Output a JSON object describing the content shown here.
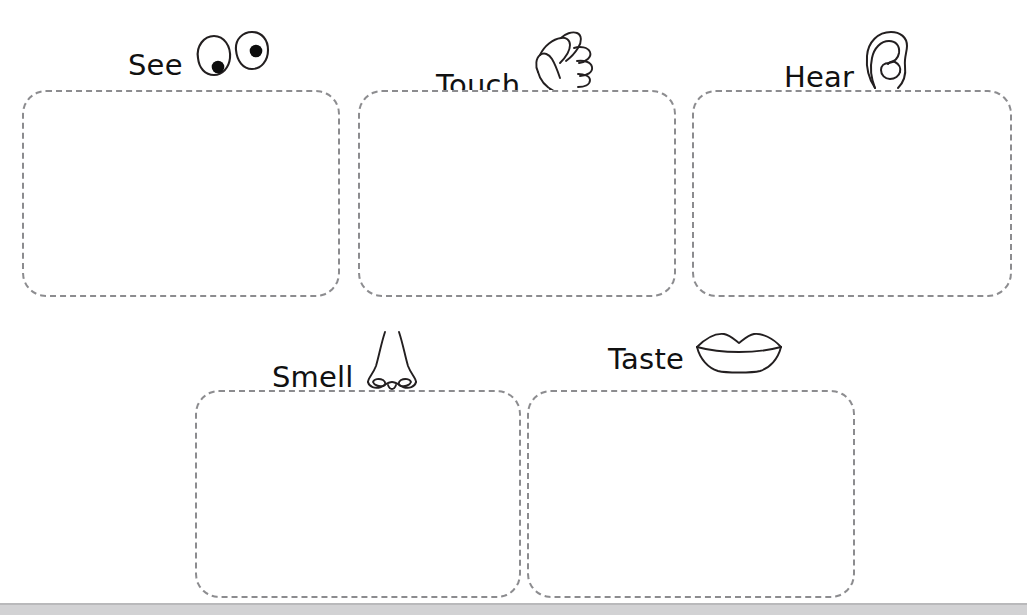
{
  "worksheet": {
    "title": "Five Senses Graphic Organizer",
    "background_color": "#ffffff",
    "box_border_color": "#8c8c8f",
    "label_text_color": "#111111",
    "icon_stroke_color": "#231f20",
    "bottom_strip_color": "#d2d2d4"
  },
  "senses": [
    {
      "id": "see",
      "label": "See",
      "icon": "eyes-icon",
      "row": 1,
      "column": 1,
      "box_empty": true,
      "box": {
        "x": 22,
        "y": 90,
        "width": 318,
        "height": 207
      },
      "head": {
        "x": 128,
        "y": 30
      }
    },
    {
      "id": "touch",
      "label": "Touch",
      "icon": "hand-icon",
      "row": 1,
      "column": 2,
      "box_empty": true,
      "box": {
        "x": 358,
        "y": 90,
        "width": 318,
        "height": 207
      },
      "head": {
        "x": 436,
        "y": 30
      }
    },
    {
      "id": "hear",
      "label": "Hear",
      "icon": "ear-icon",
      "row": 1,
      "column": 3,
      "box_empty": true,
      "box": {
        "x": 692,
        "y": 90,
        "width": 320,
        "height": 207
      },
      "head": {
        "x": 784,
        "y": 30
      }
    },
    {
      "id": "smell",
      "label": "Smell",
      "icon": "nose-icon",
      "row": 2,
      "column": 1,
      "box_empty": true,
      "box": {
        "x": 195,
        "y": 390,
        "width": 326,
        "height": 208
      },
      "head": {
        "x": 272,
        "y": 330
      }
    },
    {
      "id": "taste",
      "label": "Taste",
      "icon": "lips-icon",
      "row": 2,
      "column": 2,
      "box_empty": true,
      "box": {
        "x": 527,
        "y": 390,
        "width": 328,
        "height": 208
      },
      "head": {
        "x": 608,
        "y": 330
      }
    }
  ]
}
